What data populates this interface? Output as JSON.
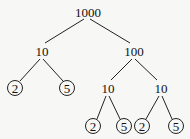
{
  "diagram": {
    "type": "factor-tree",
    "nodes": [
      {
        "id": "n1000",
        "label": "1000",
        "x": 88,
        "y": 12,
        "circled": false
      },
      {
        "id": "n10a",
        "label": "10",
        "x": 42,
        "y": 51,
        "circled": false
      },
      {
        "id": "n100",
        "label": "100",
        "x": 134,
        "y": 51,
        "circled": false
      },
      {
        "id": "n2a",
        "label": "2",
        "x": 15,
        "y": 88,
        "circled": true
      },
      {
        "id": "n5a",
        "label": "5",
        "x": 67,
        "y": 88,
        "circled": true
      },
      {
        "id": "n10b",
        "label": "10",
        "x": 108,
        "y": 88,
        "circled": false
      },
      {
        "id": "n10c",
        "label": "10",
        "x": 161,
        "y": 88,
        "circled": false
      },
      {
        "id": "n2b",
        "label": "2",
        "x": 93,
        "y": 126,
        "circled": true
      },
      {
        "id": "n5b",
        "label": "5",
        "x": 124,
        "y": 126,
        "circled": true
      },
      {
        "id": "n2c",
        "label": "2",
        "x": 142,
        "y": 126,
        "circled": true
      },
      {
        "id": "n5c",
        "label": "5",
        "x": 176,
        "y": 126,
        "circled": true
      }
    ],
    "edges": [
      {
        "from": "n1000",
        "to": "n10a",
        "x1": 84,
        "y1": 19,
        "x2": 45,
        "y2": 43
      },
      {
        "from": "n1000",
        "to": "n100",
        "x1": 90,
        "y1": 19,
        "x2": 130,
        "y2": 43
      },
      {
        "from": "n10a",
        "to": "n2a",
        "x1": 40,
        "y1": 59,
        "x2": 20,
        "y2": 81
      },
      {
        "from": "n10a",
        "to": "n5a",
        "x1": 43,
        "y1": 59,
        "x2": 63,
        "y2": 81
      },
      {
        "from": "n100",
        "to": "n10b",
        "x1": 132,
        "y1": 59,
        "x2": 111,
        "y2": 80
      },
      {
        "from": "n100",
        "to": "n10c",
        "x1": 135,
        "y1": 59,
        "x2": 157,
        "y2": 80
      },
      {
        "from": "n10b",
        "to": "n2b",
        "x1": 106,
        "y1": 96,
        "x2": 97,
        "y2": 119
      },
      {
        "from": "n10b",
        "to": "n5b",
        "x1": 109,
        "y1": 96,
        "x2": 120,
        "y2": 119
      },
      {
        "from": "n10c",
        "to": "n2c",
        "x1": 159,
        "y1": 96,
        "x2": 146,
        "y2": 119
      },
      {
        "from": "n10c",
        "to": "n5c",
        "x1": 162,
        "y1": 96,
        "x2": 172,
        "y2": 119
      }
    ],
    "circle_radius": 7.5
  }
}
